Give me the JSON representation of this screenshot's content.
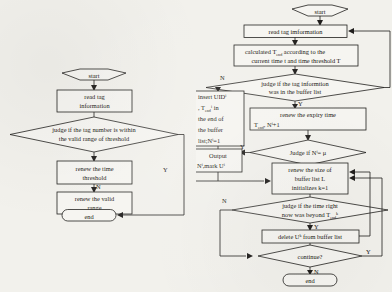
{
  "document": {
    "kind": "flowchart-pair",
    "background_color": "#f2f1ec",
    "ink_color": "#201e1c"
  },
  "left_flowchart": {
    "name": "threshold-update-flow",
    "nodes": {
      "start": "start",
      "read": {
        "line1": "read tag",
        "line2": "information"
      },
      "judge": {
        "line1": "judge  if the tag number is within",
        "line2": "the valid range of threshold"
      },
      "renew_threshold": {
        "line1": "renew the time",
        "line2": "threshold"
      },
      "renew_range": {
        "line1": "renew the valid",
        "line2": "range"
      },
      "end": "end"
    },
    "edge_labels": {
      "no": "N",
      "yes": "Y"
    }
  },
  "right_flowchart": {
    "name": "buffer-list-management-flow",
    "nodes": {
      "start": "start",
      "read": "read tag imformation",
      "calc": {
        "line1a": "calculated T",
        "line1a_sub": "end",
        "line1b": " according to the",
        "line2": "current time t and time threshold T"
      },
      "judge_in_buffer": {
        "line1": "judge if the tag informtion",
        "line2": "was in the buffer list"
      },
      "insert": {
        "line1a": "insert UID",
        "line1a_sup": "i",
        "line2a": ", T",
        "line2a_sub": "end",
        "line2a_sup": "i",
        "line2b": " in",
        "line3": "the end of",
        "line4": "the buffer",
        "line5a": "list;N",
        "line5a_sup": "i",
        "line5b": "=1"
      },
      "renew_expiry": {
        "line1": "renew the expiry time",
        "line2a": "T",
        "line2a_sub": "end",
        "line2b": ",  N",
        "line2b_sup": "i",
        "line2c": "+1"
      },
      "judge_n": {
        "text_a": "Judge if N",
        "text_a_sup": "i",
        "text_b": "= μ"
      },
      "output": {
        "line1": "Output",
        "line2a": "N",
        "line2a_sup": "i",
        "line2b": ",mark U",
        "line2b_sup": "i"
      },
      "renew_size": {
        "line1": "renew the size of",
        "line2": "buffer list  L",
        "line3": "initializes k=1"
      },
      "judge_time": {
        "line1": "judge if the time right",
        "line2a": "now was beyond T",
        "line2a_sub": "end",
        "line2a_sup": "k"
      },
      "delete": {
        "line1a": "delete   U",
        "line1a_sup": "k",
        "line1b": " from buffer list"
      },
      "continue": "continue?",
      "end": "end"
    },
    "edge_labels": {
      "no": "N",
      "yes": "Y"
    }
  }
}
